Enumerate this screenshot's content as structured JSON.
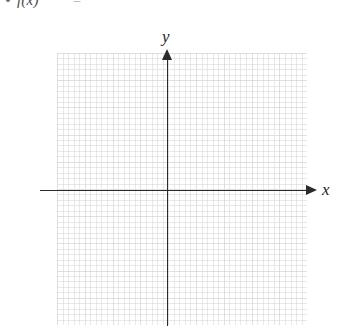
{
  "formula": {
    "bullet": "•",
    "function_text": "f(x)",
    "equals": "=",
    "right_side": ""
  },
  "graph": {
    "title": "",
    "x_axis_label": "x",
    "y_axis_label": "y",
    "grid_visible": true,
    "origin_label": ""
  },
  "chart_data": {
    "type": "line",
    "title": "",
    "xlabel": "x",
    "ylabel": "y",
    "series": [],
    "grid": true,
    "legend": "none",
    "xlim": [
      -4,
      5
    ],
    "ylim": [
      -5,
      5
    ],
    "note": "Empty coordinate grid for graphing f(x); no plotted data"
  }
}
